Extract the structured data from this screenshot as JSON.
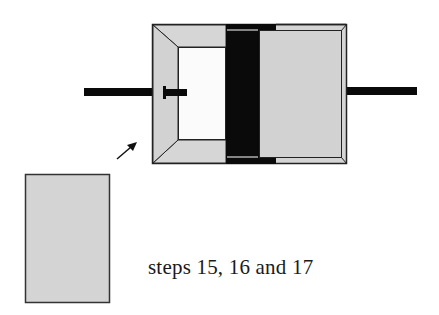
{
  "diagram": {
    "caption": "steps 15, 16 and 17",
    "components": [
      {
        "id": "left-rod",
        "label": "left rod"
      },
      {
        "id": "cylinder-housing",
        "label": "cylinder housing"
      },
      {
        "id": "plunger-stub",
        "label": "plunger stub"
      },
      {
        "id": "open-chamber",
        "label": "open chamber"
      },
      {
        "id": "piston",
        "label": "piston"
      },
      {
        "id": "right-panel",
        "label": "right panel"
      },
      {
        "id": "right-rod",
        "label": "right rod"
      },
      {
        "id": "pointer-arrow",
        "label": "pointer arrow"
      },
      {
        "id": "loose-panel",
        "label": "loose panel"
      }
    ],
    "colors": {
      "fill_gray": "#d4d4d4",
      "chamber_white": "#fbfbfb",
      "black": "#0a0a0a",
      "stroke": "#222222"
    }
  }
}
